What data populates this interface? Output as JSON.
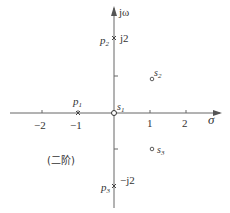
{
  "diagram": {
    "type": "s-plane pole-zero plot",
    "axes": {
      "x_label": "σ",
      "y_label": "jω",
      "x_ticks": [
        "−2",
        "−1",
        "1",
        "2"
      ],
      "y_ticks": [
        "j2",
        "−j2"
      ]
    },
    "poles": [
      {
        "id": "p1",
        "label": "p",
        "sub": "1",
        "re": -1,
        "im": 0
      },
      {
        "id": "p2",
        "label": "p",
        "sub": "2",
        "re": 0,
        "im": 2,
        "tick": "j2"
      },
      {
        "id": "p3",
        "label": "p",
        "sub": "3",
        "re": 0,
        "im": -2,
        "tick": "−j2"
      }
    ],
    "zeros": [
      {
        "id": "s1",
        "label": "s",
        "sub": "1",
        "re": 0,
        "im": 0
      },
      {
        "id": "s2",
        "label": "s",
        "sub": "2",
        "re": 1,
        "im": 1
      },
      {
        "id": "s3",
        "label": "s",
        "sub": "3",
        "re": 1,
        "im": -1
      }
    ],
    "note": "(二阶)",
    "colors": {
      "axis": "#555555",
      "text": "#333333"
    }
  }
}
